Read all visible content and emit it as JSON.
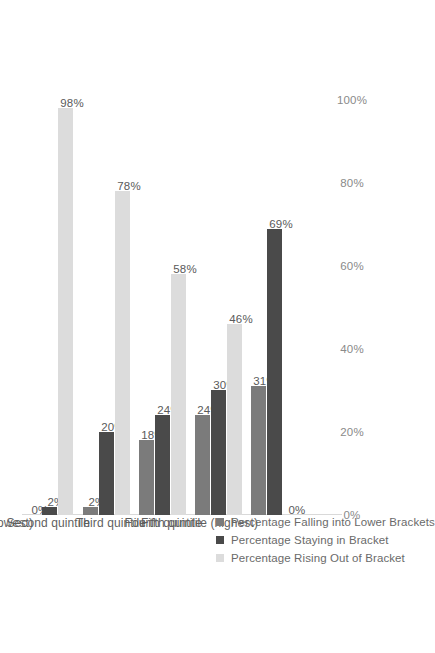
{
  "chart_data": {
    "type": "bar",
    "orientation": "rotated-90",
    "title": "",
    "xlabel": "",
    "ylabel": "",
    "ylim": [
      0,
      100
    ],
    "grid": false,
    "legend_position": "center",
    "categories": [
      "First quintile (lowest)",
      "Second quintile",
      "Third quintile",
      "Fourth quintile",
      "Fifth quintile (highest)"
    ],
    "tick_labels": [
      "0%",
      "20%",
      "40%",
      "60%",
      "80%",
      "100%"
    ],
    "tick_values": [
      0,
      20,
      40,
      60,
      80,
      100
    ],
    "series": [
      {
        "name": "Percentage Falling into Lower Brackets",
        "color": "#7b7b7b",
        "values": [
          0,
          2,
          18,
          24,
          31
        ],
        "labels": [
          "0%",
          "2%",
          "18%",
          "24%",
          "31%"
        ]
      },
      {
        "name": "Percentage Staying in Bracket",
        "color": "#4a4a4a",
        "values": [
          2,
          20,
          24,
          30,
          69
        ],
        "labels": [
          "2%",
          "20%",
          "24%",
          "30%",
          "69%"
        ]
      },
      {
        "name": "Percentage Rising Out of Bracket",
        "color": "#dcdcdc",
        "values": [
          98,
          78,
          58,
          46,
          0
        ],
        "labels": [
          "98%",
          "78%",
          "58%",
          "46%",
          "0%"
        ]
      }
    ]
  },
  "legend": {
    "items": [
      {
        "label": "Percentage Falling into Lower Brackets"
      },
      {
        "label": "Percentage Staying in Bracket"
      },
      {
        "label": "Percentage Rising Out of Bracket"
      }
    ]
  },
  "axis": {
    "ticks": [
      {
        "label": "0%"
      },
      {
        "label": "20%"
      },
      {
        "label": "40%"
      },
      {
        "label": "60%"
      },
      {
        "label": "80%"
      },
      {
        "label": "100%"
      }
    ]
  }
}
